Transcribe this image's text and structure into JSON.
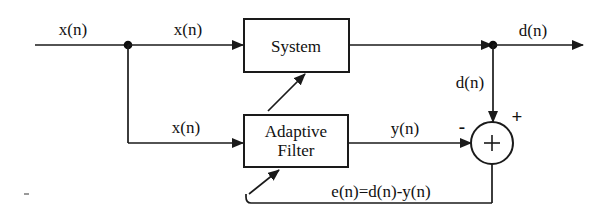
{
  "diagram": {
    "type": "block-diagram",
    "canvas": {
      "width": 609,
      "height": 219,
      "background": "#ffffff"
    },
    "stroke_color": "#1a1a1a",
    "blocks": [
      {
        "id": "system",
        "label": "System",
        "x": 244,
        "y": 19,
        "w": 105,
        "h": 53,
        "cx": 296,
        "cy": 45
      },
      {
        "id": "adaptive-filter",
        "label": "Adaptive\nFilter",
        "x": 244,
        "y": 115,
        "w": 104,
        "h": 52,
        "cx": 296,
        "cy": 141
      }
    ],
    "summer": {
      "id": "summing-junction",
      "cx": 492,
      "cy": 143,
      "r": 21,
      "inner_symbol": "+",
      "sign_top": "+",
      "sign_left": "-"
    },
    "junctions": [
      {
        "id": "input-split-node",
        "cx": 128,
        "cy": 45,
        "r": 4
      },
      {
        "id": "output-split-node",
        "cx": 493,
        "cy": 45,
        "r": 4
      }
    ],
    "labels": [
      {
        "id": "label-input-x",
        "text": "x(n)",
        "x": 73,
        "y": 30
      },
      {
        "id": "label-system-input-x",
        "text": "x(n)",
        "x": 188,
        "y": 30
      },
      {
        "id": "label-filter-input-x",
        "text": "x(n)",
        "x": 186,
        "y": 128
      },
      {
        "id": "label-filter-out-y",
        "text": "y(n)",
        "x": 405,
        "y": 129
      },
      {
        "id": "label-output-d",
        "text": "d(n)",
        "x": 533,
        "y": 31
      },
      {
        "id": "label-branch-d",
        "text": "d(n)",
        "x": 470,
        "y": 83
      },
      {
        "id": "label-error",
        "text": "e(n)=d(n)-y(n)",
        "x": 381,
        "y": 192
      },
      {
        "id": "label-sign-minus",
        "text": "-",
        "x": 462,
        "y": 127
      },
      {
        "id": "label-sign-plus",
        "text": "+",
        "x": 517,
        "y": 117
      }
    ],
    "signals": [
      {
        "id": "input-line",
        "from": "source",
        "to": "input-split-node"
      },
      {
        "id": "system-input",
        "from": "input-split-node",
        "to": "system"
      },
      {
        "id": "filter-input",
        "from": "input-split-node",
        "to": "adaptive-filter"
      },
      {
        "id": "system-output",
        "from": "system",
        "to": "output-split-node"
      },
      {
        "id": "desired-output",
        "from": "output-split-node",
        "to": "sink"
      },
      {
        "id": "desired-branch",
        "from": "output-split-node",
        "to": "summing-junction"
      },
      {
        "id": "filter-output",
        "from": "adaptive-filter",
        "to": "summing-junction"
      },
      {
        "id": "error-feedback",
        "from": "summing-junction",
        "to": "adaptive-filter"
      },
      {
        "id": "adaptation-link",
        "from": "adaptive-filter",
        "to": "system"
      }
    ]
  }
}
